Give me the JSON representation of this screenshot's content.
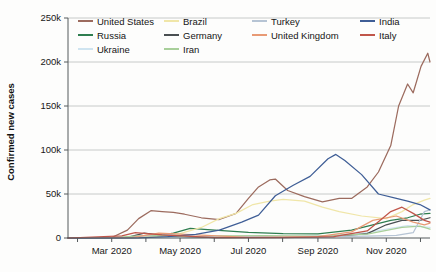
{
  "chart_data": {
    "type": "line",
    "title": "",
    "xlabel": "",
    "ylabel": "Confirmed new cases",
    "ylim": [
      0,
      250000
    ],
    "ytick_labels": [
      "0",
      "50k",
      "100k",
      "150k",
      "200k",
      "250k"
    ],
    "ytick_values": [
      0,
      50000,
      100000,
      150000,
      200000,
      250000
    ],
    "xtick_labels": [
      "Mar 2020",
      "May 2020",
      "Jul 2020",
      "Sep 2020",
      "Nov 2020"
    ],
    "xtick_values": [
      "2020-03-01",
      "2020-05-01",
      "2020-07-01",
      "2020-09-01",
      "2020-11-01"
    ],
    "x_range": [
      "2020-01-22",
      "2020-12-10"
    ],
    "grid": "horizontal",
    "legend_position": "top-inside",
    "series": [
      {
        "name": "United States",
        "color": "#9c6b5e",
        "x": [
          "2020-01-22",
          "2020-02-15",
          "2020-03-01",
          "2020-03-15",
          "2020-03-25",
          "2020-04-05",
          "2020-04-15",
          "2020-04-25",
          "2020-05-05",
          "2020-05-20",
          "2020-06-05",
          "2020-06-20",
          "2020-07-01",
          "2020-07-10",
          "2020-07-20",
          "2020-07-25",
          "2020-08-05",
          "2020-08-20",
          "2020-09-05",
          "2020-09-20",
          "2020-10-01",
          "2020-10-15",
          "2020-10-25",
          "2020-11-05",
          "2020-11-12",
          "2020-11-20",
          "2020-11-25",
          "2020-12-02",
          "2020-12-08",
          "2020-12-10"
        ],
        "values": [
          0,
          0,
          500,
          9000,
          22000,
          31000,
          30000,
          29000,
          27000,
          23000,
          21000,
          28000,
          45000,
          58000,
          66000,
          67000,
          54000,
          47000,
          41000,
          45000,
          45000,
          58000,
          75000,
          105000,
          150000,
          175000,
          165000,
          195000,
          210000,
          200000
        ]
      },
      {
        "name": "Russia",
        "color": "#2e7d4f",
        "x": [
          "2020-01-22",
          "2020-03-15",
          "2020-04-05",
          "2020-04-25",
          "2020-05-10",
          "2020-06-01",
          "2020-07-01",
          "2020-08-01",
          "2020-09-01",
          "2020-10-01",
          "2020-10-20",
          "2020-11-05",
          "2020-11-20",
          "2020-12-01",
          "2020-12-10"
        ],
        "values": [
          0,
          100,
          1000,
          5500,
          11000,
          9000,
          6500,
          5000,
          4800,
          9000,
          15000,
          20000,
          23000,
          27000,
          28000
        ]
      },
      {
        "name": "Ukraine",
        "color": "#cfe4f0",
        "x": [
          "2020-01-22",
          "2020-04-01",
          "2020-06-01",
          "2020-08-01",
          "2020-09-15",
          "2020-10-15",
          "2020-11-05",
          "2020-11-20",
          "2020-12-01",
          "2020-12-10"
        ],
        "values": [
          0,
          200,
          600,
          1200,
          3000,
          6000,
          11000,
          14000,
          13000,
          12000
        ]
      },
      {
        "name": "Brazil",
        "color": "#f0e6a8",
        "x": [
          "2020-01-22",
          "2020-03-15",
          "2020-04-10",
          "2020-05-01",
          "2020-05-20",
          "2020-06-05",
          "2020-06-20",
          "2020-07-05",
          "2020-07-20",
          "2020-08-01",
          "2020-08-20",
          "2020-09-05",
          "2020-09-20",
          "2020-10-10",
          "2020-11-01",
          "2020-11-15",
          "2020-11-25",
          "2020-12-05",
          "2020-12-10"
        ],
        "values": [
          0,
          100,
          1800,
          5000,
          12000,
          22000,
          28000,
          38000,
          42000,
          44000,
          42000,
          35000,
          30000,
          25000,
          22000,
          30000,
          38000,
          43000,
          45000
        ]
      },
      {
        "name": "Germany",
        "color": "#4a4f52",
        "x": [
          "2020-01-22",
          "2020-03-15",
          "2020-03-30",
          "2020-04-20",
          "2020-06-01",
          "2020-08-01",
          "2020-09-15",
          "2020-10-15",
          "2020-11-01",
          "2020-11-15",
          "2020-12-01",
          "2020-12-10"
        ],
        "values": [
          0,
          800,
          5500,
          2500,
          500,
          700,
          1500,
          5000,
          15000,
          20000,
          20000,
          23000
        ]
      },
      {
        "name": "Iran",
        "color": "#a8cf9a",
        "x": [
          "2020-01-22",
          "2020-03-01",
          "2020-04-01",
          "2020-05-15",
          "2020-06-05",
          "2020-07-15",
          "2020-09-01",
          "2020-10-15",
          "2020-11-15",
          "2020-12-01",
          "2020-12-10"
        ],
        "values": [
          0,
          400,
          3000,
          1500,
          2500,
          2700,
          2000,
          4500,
          12000,
          13500,
          10000
        ]
      },
      {
        "name": "Turkey",
        "color": "#b6c4d4",
        "x": [
          "2020-01-22",
          "2020-03-20",
          "2020-04-12",
          "2020-05-15",
          "2020-07-01",
          "2020-09-01",
          "2020-10-15",
          "2020-11-10",
          "2020-11-25",
          "2020-12-05",
          "2020-12-10"
        ],
        "values": [
          0,
          500,
          5000,
          1700,
          1200,
          1600,
          2200,
          3000,
          6000,
          30000,
          32000
        ]
      },
      {
        "name": "United Kingdom",
        "color": "#e89a75",
        "x": [
          "2020-01-22",
          "2020-03-20",
          "2020-04-12",
          "2020-05-15",
          "2020-07-01",
          "2020-09-01",
          "2020-10-01",
          "2020-10-20",
          "2020-11-10",
          "2020-11-25",
          "2020-12-05",
          "2020-12-10"
        ],
        "values": [
          0,
          800,
          5500,
          3500,
          600,
          1500,
          7000,
          20000,
          25000,
          18000,
          15000,
          17000
        ]
      },
      {
        "name": "India",
        "color": "#3f5e96",
        "x": [
          "2020-01-22",
          "2020-03-25",
          "2020-04-20",
          "2020-05-15",
          "2020-06-05",
          "2020-06-25",
          "2020-07-10",
          "2020-07-25",
          "2020-08-10",
          "2020-08-25",
          "2020-09-10",
          "2020-09-17",
          "2020-09-25",
          "2020-10-10",
          "2020-10-25",
          "2020-11-10",
          "2020-11-20",
          "2020-12-01",
          "2020-12-10"
        ],
        "values": [
          0,
          200,
          1500,
          4000,
          9000,
          18000,
          26000,
          48000,
          60000,
          70000,
          90000,
          95000,
          88000,
          72000,
          50000,
          45000,
          42000,
          38000,
          32000
        ]
      },
      {
        "name": "Italy",
        "color": "#c0564a",
        "x": [
          "2020-01-22",
          "2020-03-10",
          "2020-03-22",
          "2020-04-15",
          "2020-06-01",
          "2020-08-01",
          "2020-09-15",
          "2020-10-15",
          "2020-11-05",
          "2020-11-15",
          "2020-11-25",
          "2020-12-05",
          "2020-12-10"
        ],
        "values": [
          0,
          2500,
          6000,
          3500,
          400,
          350,
          1500,
          8000,
          30000,
          35000,
          28000,
          20000,
          18000
        ]
      }
    ]
  },
  "axis": {
    "y_title": "Confirmed new cases"
  },
  "legend": {
    "entries": [
      {
        "label": "United States",
        "color": "#9c6b5e"
      },
      {
        "label": "Brazil",
        "color": "#f0e6a8"
      },
      {
        "label": "Turkey",
        "color": "#b6c4d4"
      },
      {
        "label": "India",
        "color": "#3f5e96"
      },
      {
        "label": "Russia",
        "color": "#2e7d4f"
      },
      {
        "label": "Germany",
        "color": "#4a4f52"
      },
      {
        "label": "United Kingdom",
        "color": "#e89a75"
      },
      {
        "label": "Italy",
        "color": "#c0564a"
      },
      {
        "label": "Ukraine",
        "color": "#cfe4f0"
      },
      {
        "label": "Iran",
        "color": "#a8cf9a"
      },
      {
        "label": "",
        "color": ""
      },
      {
        "label": "",
        "color": ""
      }
    ]
  }
}
